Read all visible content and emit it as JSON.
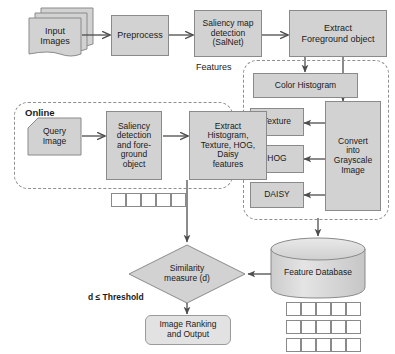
{
  "diagram": {
    "colors": {
      "process_fill": "#d2d2d2",
      "process_stroke": "#8a8a8a",
      "rounded_fill": "#e2e2e2",
      "group_dash": "#8f8f8f",
      "arrow": "#4d4d4d",
      "text": "#1a1a1a",
      "cylinder_fill": "#d9d9d9"
    },
    "offline_pipeline": {
      "input_images": "Input\nImages",
      "preprocess": "Preprocess",
      "saliency_map": "Saliency map\ndetection\n(SalNet)",
      "extract_foreground": "Extract\nForeground object"
    },
    "features_group": {
      "label": "Features",
      "color_histogram": "Color Histogram",
      "texture": "Texture",
      "hog": "HOG",
      "daisy": "DAISY",
      "convert_grayscale": "Convert\ninto\nGrayscale\nImage"
    },
    "online_group": {
      "label": "Online",
      "query_image": "Query\nImage",
      "saliency_detection": "Saliency\ndetection\nand fore-\nground\nobject",
      "extract_features": "Extract\nHistogram,\nTexture, HOG,\nDaisy\nfeatures"
    },
    "matching": {
      "similarity": "Similarity\nmeasure (d)",
      "threshold_label": "d ≤ Threshold",
      "output": "Image Ranking\nand Output",
      "feature_database": "Feature Database"
    },
    "vectors": {
      "query_vector_cells": 5,
      "db_vector_rows": 3,
      "db_vector_cells": 5
    }
  }
}
